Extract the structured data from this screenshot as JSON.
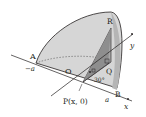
{
  "diagram": {
    "points": {
      "A": "A",
      "B": "B",
      "O": "O",
      "P": "P(x, 0)",
      "Q": "Q",
      "R": "R"
    },
    "axis_labels": {
      "x": "x",
      "y": "y",
      "neg_a": "−a",
      "a": "a"
    },
    "angle_label": "30°",
    "colors": {
      "surface": "#d4d4d4",
      "triangle": "#9a9a9a",
      "triangle_light": "#bdbdbd",
      "line": "#231f20"
    }
  }
}
